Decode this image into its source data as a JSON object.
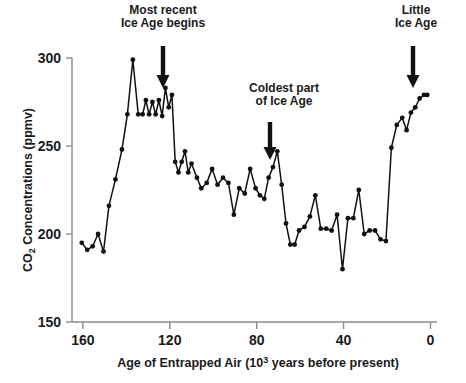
{
  "chart_data": {
    "type": "line",
    "title": "",
    "subtitle": "",
    "xlabel_prefix": "Age of Entrapped Air (10",
    "xlabel_sup": "3",
    "xlabel_suffix": " years before present)",
    "xlabel_plain": "Age of Entrapped Air (10^3 years before present)",
    "ylabel_prefix": "CO",
    "ylabel_sub": "2",
    "ylabel_suffix": " Concentrations (ppmv)",
    "ylabel_plain": "CO2 Concentrations (ppmv)",
    "xlim": [
      165,
      -3
    ],
    "ylim": [
      150,
      300
    ],
    "x_ticks": [
      160,
      120,
      80,
      40,
      0
    ],
    "x_tick_labels": [
      "160",
      "120",
      "80",
      "40",
      "0"
    ],
    "y_ticks": [
      150,
      200,
      250,
      300
    ],
    "y_tick_labels": [
      "150",
      "200",
      "250",
      "300"
    ],
    "grid": false,
    "legend": "none",
    "series_name": "CO2 concentration",
    "line_color": "#111111",
    "marker_color": "#111111",
    "axis_color": "#8a8a8a",
    "x": [
      160.5,
      158.0,
      155.5,
      153.0,
      150.5,
      148.0,
      145.0,
      142.0,
      139.5,
      137.0,
      134.5,
      132.5,
      131.0,
      129.5,
      128.0,
      126.5,
      125.0,
      123.5,
      122.0,
      120.5,
      119.0,
      117.5,
      116.0,
      114.5,
      113.0,
      111.5,
      110.0,
      107.5,
      105.5,
      103.0,
      100.5,
      98.0,
      95.5,
      93.0,
      90.5,
      88.0,
      85.5,
      83.0,
      80.5,
      78.5,
      76.5,
      74.5,
      72.5,
      70.5,
      68.5,
      66.5,
      64.5,
      62.5,
      60.5,
      58.0,
      55.5,
      53.0,
      50.5,
      48.0,
      45.5,
      43.0,
      40.5,
      38.0,
      35.5,
      33.0,
      30.5,
      28.0,
      25.5,
      23.0,
      20.5,
      18.0,
      15.5,
      13.0,
      11.0,
      9.0,
      7.0,
      5.0,
      3.0,
      1.5
    ],
    "y": [
      195,
      191,
      193,
      200,
      190,
      216,
      231,
      248,
      268,
      299,
      268,
      268,
      276,
      268,
      275,
      268,
      276,
      267,
      283,
      272,
      279,
      241,
      235,
      241,
      247,
      235,
      240,
      232,
      226,
      229,
      237,
      228,
      232,
      229,
      211,
      226,
      223,
      237,
      226,
      222,
      220,
      232,
      238,
      247,
      228,
      206,
      194,
      194,
      202,
      204,
      210,
      222,
      203,
      203,
      202,
      211,
      180,
      209,
      209,
      225,
      200,
      202,
      202,
      197,
      196,
      249,
      262,
      266,
      259,
      269,
      272,
      277,
      279,
      279
    ]
  },
  "annotations": [
    {
      "id": "most-recent-ice-age",
      "line1": "Most recent",
      "line2": "Ice Age begins",
      "text_x": 163,
      "text_y": 14,
      "arrow_x": 163,
      "arrow_top": 46,
      "arrow_bottom": 88
    },
    {
      "id": "coldest-part-of-ice-age",
      "line1": "Coldest part",
      "line2": "of Ice Age",
      "text_x": 284,
      "text_y": 92,
      "arrow_x": 270,
      "arrow_top": 122,
      "arrow_bottom": 160
    },
    {
      "id": "little-ice-age",
      "line1": "Little",
      "line2": "Ice Age",
      "text_x": 416,
      "text_y": 14,
      "arrow_x": 413,
      "arrow_top": 46,
      "arrow_bottom": 88
    }
  ]
}
